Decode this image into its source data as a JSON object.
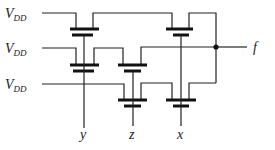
{
  "diagram": {
    "title": "",
    "type": "pass-transistor network",
    "supply_label_main": "V",
    "supply_label_sub": "DD",
    "supplies": [
      {
        "id": "vdd1",
        "main": "V",
        "sub": "DD"
      },
      {
        "id": "vdd2",
        "main": "V",
        "sub": "DD"
      },
      {
        "id": "vdd3",
        "main": "V",
        "sub": "DD"
      }
    ],
    "inputs": [
      {
        "id": "y",
        "label": "y"
      },
      {
        "id": "z",
        "label": "z"
      },
      {
        "id": "x",
        "label": "x"
      }
    ],
    "output": {
      "id": "f",
      "label": "f"
    },
    "transistors": [
      {
        "id": "T1",
        "gate": "y",
        "row": 1
      },
      {
        "id": "T2",
        "gate": "x",
        "row": 1
      },
      {
        "id": "T3",
        "gate": "y",
        "row": 2
      },
      {
        "id": "T4",
        "gate": "z",
        "row": 2
      },
      {
        "id": "T5",
        "gate": "z",
        "row": 3
      },
      {
        "id": "T6",
        "gate": "x",
        "row": 3
      }
    ],
    "colors": {
      "line": "#222222",
      "background": "#ffffff"
    }
  }
}
